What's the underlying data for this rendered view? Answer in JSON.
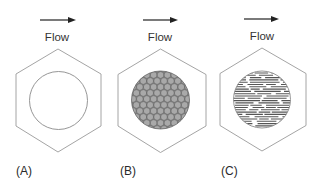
{
  "figure": {
    "colors": {
      "background": "#ffffff",
      "hexagon_stroke": "#9a9a9a",
      "circle_stroke": "#8a8a8a",
      "arrow": "#222222",
      "granule_fill": "#a8a8a8",
      "granule_stroke": "#4a4a4a",
      "fiber_line": "#555555"
    },
    "panels": [
      {
        "id": "A",
        "label": "(A)",
        "flow_label": "Flow",
        "fill": "empty",
        "description": "Empty circular cross-section inside hexagonal housing"
      },
      {
        "id": "B",
        "label": "(B)",
        "flow_label": "Flow",
        "fill": "packed-spheres",
        "description": "Circular cross-section packed with spherical particles"
      },
      {
        "id": "C",
        "label": "(C)",
        "flow_label": "Flow",
        "fill": "horizontal-fibers",
        "description": "Circular cross-section filled with fibers aligned with flow"
      }
    ]
  }
}
